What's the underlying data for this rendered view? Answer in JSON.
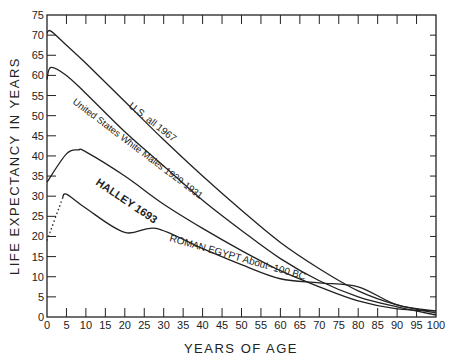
{
  "chart_data": {
    "type": "line",
    "title": "",
    "xlabel": "YEARS OF AGE",
    "ylabel": "LIFE EXPECTANCY IN YEARS",
    "xlim": [
      0,
      100
    ],
    "ylim": [
      0,
      75
    ],
    "x_ticks": [
      0,
      5,
      10,
      15,
      20,
      25,
      30,
      35,
      40,
      45,
      50,
      55,
      60,
      65,
      70,
      75,
      80,
      85,
      90,
      95,
      100
    ],
    "y_ticks": [
      0,
      5,
      10,
      15,
      20,
      25,
      30,
      35,
      40,
      45,
      50,
      55,
      60,
      65,
      70,
      75
    ],
    "grid": false,
    "legend": "inline curve labels",
    "series": [
      {
        "name": "U.S. all 1967",
        "x": [
          0,
          1,
          5,
          10,
          20,
          30,
          40,
          50,
          60,
          70,
          80,
          90,
          100
        ],
        "y": [
          70.5,
          71,
          67.5,
          63,
          53.5,
          44,
          35,
          26.5,
          18.5,
          12,
          6.5,
          3,
          1
        ]
      },
      {
        "name": "United States White Males 1929-1931",
        "x": [
          0,
          1,
          5,
          10,
          20,
          30,
          40,
          50,
          60,
          70,
          80,
          90,
          100
        ],
        "y": [
          59,
          62,
          60,
          55.5,
          46,
          37.5,
          29,
          21.5,
          14.5,
          9,
          5,
          2.5,
          0.5
        ]
      },
      {
        "name": "HALLEY 1693",
        "x": [
          0,
          5,
          8,
          10,
          20,
          30,
          40,
          50,
          60,
          70,
          80,
          90,
          100
        ],
        "y": [
          33.5,
          40.5,
          41.5,
          41,
          35,
          28,
          22,
          16.5,
          11.5,
          7.5,
          4,
          2,
          1.5
        ]
      },
      {
        "name": "ROMAN EGYPT About ~100 BC",
        "x": [
          0,
          4,
          5,
          10,
          20,
          28,
          40,
          50,
          60,
          70,
          80,
          90,
          100
        ],
        "y": [
          19,
          29.5,
          30.5,
          27,
          21,
          22,
          17,
          13,
          9.5,
          8.5,
          7.5,
          3,
          1.5
        ],
        "note": "dotted segment from age 0 to 4"
      }
    ]
  },
  "labels": {
    "xlabel": "YEARS OF AGE",
    "ylabel": "LIFE EXPECTANCY IN YEARS",
    "us1967": "U.S. all 1967",
    "uswm": "United States White Males 1929-1931",
    "halley": "HALLEY 1693",
    "egypt": "ROMAN EGYPT About~100 BC"
  }
}
